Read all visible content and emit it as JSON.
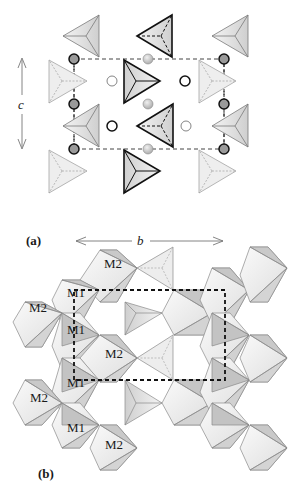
{
  "figure": {
    "panels": [
      {
        "id": "a",
        "label": "(a)",
        "axes": {
          "vertical": "c",
          "horizontal": "b"
        },
        "description": "Projection showing tetrahedra and cation sites within a dashed unit cell"
      },
      {
        "id": "b",
        "label": "(b)",
        "site_labels": [
          "M2",
          "M1",
          "M2",
          "M1",
          "M2",
          "M1",
          "M1",
          "M2"
        ],
        "description": "Polyhedral chains of octahedra (M1, M2 sites) linked by tetrahedra with dashed unit cell"
      }
    ],
    "colors": {
      "line": "#4a4a4a",
      "bold_line": "#111111",
      "face_light": "#ececec",
      "face_mid": "#d6d6d6",
      "face_dark": "#b4b4b4",
      "faded": "#f1f1f1",
      "circle_fill": "#c8c8c8"
    }
  }
}
